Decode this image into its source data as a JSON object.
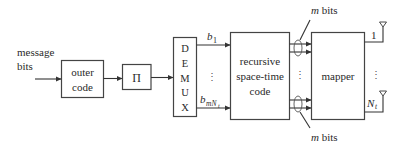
{
  "diagram": {
    "input": {
      "label_line1": "message",
      "label_line2": "bits"
    },
    "blocks": {
      "outer_code": {
        "line1": "outer",
        "line2": "code"
      },
      "interleaver": {
        "label": "Π"
      },
      "demux": {
        "letters": [
          "D",
          "E",
          "M",
          "U",
          "X"
        ]
      },
      "rstc": {
        "line1": "recursive",
        "line2": "space-time",
        "line3": "code"
      },
      "mapper": {
        "label": "mapper"
      }
    },
    "signals": {
      "first_bit": "b",
      "first_bit_sub": "1",
      "last_bit": "b",
      "last_bit_sub": "mN",
      "last_bit_subsub": "t",
      "m_bits_top": "m bits",
      "m_bits_bottom": "m bits",
      "m_italic": "m",
      "bits_word": " bits",
      "output_first": "1",
      "output_last": "N",
      "output_last_sub": "t",
      "ellipsis": "⋮"
    },
    "colors": {
      "stroke": "#444444",
      "text": "#2a2a2a",
      "background": "#ffffff"
    }
  }
}
